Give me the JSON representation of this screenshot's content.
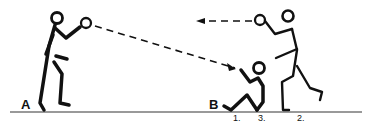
{
  "labels": {
    "player_a": "A",
    "player_b": "B",
    "pos1": "1.",
    "pos2": "2.",
    "pos3": "3."
  },
  "colors": {
    "ink": "#111111",
    "background": "#ffffff",
    "ground": "#777777"
  }
}
